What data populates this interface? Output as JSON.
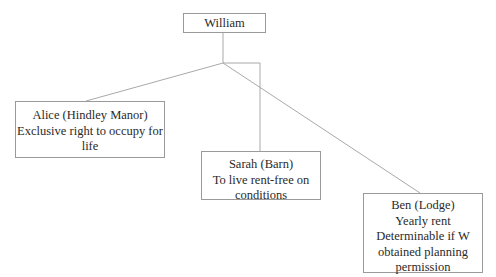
{
  "diagram": {
    "type": "tree",
    "root": {
      "id": "william",
      "label": "William"
    },
    "children": [
      {
        "id": "alice",
        "lines": [
          "Alice (Hindley Manor)",
          "Exclusive right to occupy for",
          "life"
        ]
      },
      {
        "id": "sarah",
        "lines": [
          "Sarah (Barn)",
          "To live rent-free on",
          "conditions"
        ]
      },
      {
        "id": "ben",
        "lines": [
          "Ben (Lodge)",
          "Yearly rent",
          "Determinable if W",
          "obtained planning",
          "permission"
        ]
      }
    ],
    "colors": {
      "connector": "#a9a9a9",
      "border": "#9a9a9a",
      "text": "#2a2a2a",
      "background": "#ffffff"
    }
  }
}
